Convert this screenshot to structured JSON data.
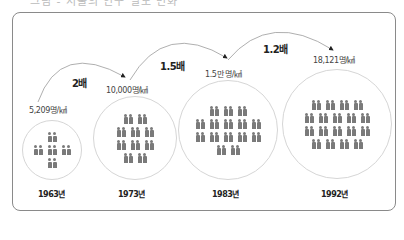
{
  "title_clipped": "그림 - 서울의 인구 밀도 변화",
  "chart_data": {
    "type": "pictogram",
    "title": "",
    "unit": "명/㎢",
    "categories": [
      "1963년",
      "1973년",
      "1983년",
      "1992년"
    ],
    "values": [
      5209,
      10000,
      15000,
      18121
    ],
    "density_labels": [
      "5,209명/㎢",
      "10,000명/㎢",
      "1.5만 명/㎢",
      "18,121명/㎢"
    ],
    "icon_pairs": [
      5,
      10,
      15,
      18
    ],
    "icon_rows": [
      [
        1,
        3,
        1
      ],
      [
        2,
        3,
        3,
        2
      ],
      [
        3,
        5,
        5,
        2
      ],
      [
        4,
        5,
        5,
        4
      ]
    ],
    "growth_multipliers": [
      "2배",
      "1.5배",
      "1.2배"
    ]
  },
  "colors": {
    "icon": "#7a7a7a",
    "frame": "#8a8a8a",
    "circle": "#d6d6d6",
    "arc": "#9a9a9a"
  }
}
